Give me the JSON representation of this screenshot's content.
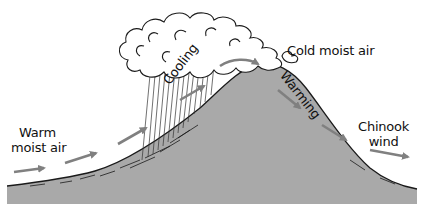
{
  "diagram": {
    "type": "chinook-wind-formation",
    "labels": {
      "warm_moist_air": [
        "Warm",
        "moist air"
      ],
      "cooling": "Cooling",
      "cold_moist_air": "Cold moist air",
      "warming": "Warming",
      "chinook_wind": [
        "Chinook",
        "wind"
      ]
    },
    "icons": {
      "mountain": "mountain-shape",
      "cloud": "cumulus-cloud",
      "rain": "precipitation-lines",
      "arrows": "airflow-arrows"
    },
    "colors": {
      "mountain_fill": "#a9a9a9",
      "outline": "#1a1a1a",
      "arrow": "#808080",
      "cloud_fill": "#ffffff",
      "background": "#ffffff"
    }
  }
}
